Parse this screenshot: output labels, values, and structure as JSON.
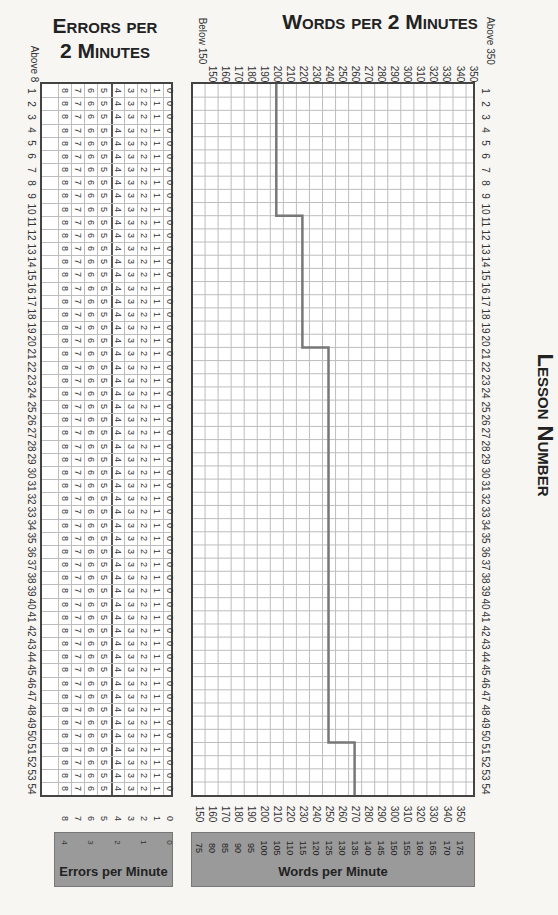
{
  "header": {
    "lesson_title": "Lesson Number",
    "words_title": "Words per 2 Minutes",
    "errors_title_line1": "Errors per",
    "errors_title_line2": "2 Minutes",
    "below_label": "Below 150",
    "above_label": "Above 350",
    "above_errors_label": "Above 8"
  },
  "words_axis": {
    "two_minute_ticks": [
      "150",
      "160",
      "170",
      "180",
      "190",
      "200",
      "210",
      "220",
      "230",
      "240",
      "250",
      "260",
      "270",
      "280",
      "290",
      "300",
      "310",
      "320",
      "330",
      "340",
      "350"
    ],
    "one_minute_ticks": [
      "75",
      "80",
      "85",
      "90",
      "95",
      "100",
      "105",
      "110",
      "115",
      "120",
      "125",
      "130",
      "135",
      "140",
      "145",
      "150",
      "155",
      "160",
      "165",
      "170",
      "175"
    ],
    "box_label": "Words per Minute"
  },
  "errors_axis": {
    "two_minute_ticks": [
      "8",
      "7",
      "6",
      "5",
      "4",
      "3",
      "2",
      "1",
      "0"
    ],
    "one_minute_ticks": [
      "4",
      "3",
      "2",
      "1",
      "0"
    ],
    "box_label": "Errors per Minute"
  },
  "lessons": {
    "count": 54
  },
  "colors": {
    "grid_line": "#bdbdbd",
    "step_line": "#777777",
    "gray_box": "#9a9a9a",
    "border": "#444444"
  },
  "chart_data": [
    {
      "type": "line",
      "title": "Words per 2 Minutes",
      "xlabel": "Words per 2 Minutes",
      "ylabel": "Lesson Number",
      "x_range": [
        150,
        350
      ],
      "y_range": [
        1,
        54
      ],
      "grid": true,
      "series": [
        {
          "name": "Target words per 2 minutes",
          "x": [
            1,
            10,
            11,
            20,
            21,
            50,
            51,
            54
          ],
          "values": [
            200,
            200,
            220,
            220,
            240,
            240,
            260,
            260
          ]
        }
      ],
      "segments": [
        {
          "lessons": "1-10",
          "words_per_2min": 200,
          "words_per_min": 100
        },
        {
          "lessons": "11-20",
          "words_per_2min": 220,
          "words_per_min": 110
        },
        {
          "lessons": "21-50",
          "words_per_2min": 240,
          "words_per_min": 120
        },
        {
          "lessons": "51-54",
          "words_per_2min": 260,
          "words_per_min": 130
        }
      ],
      "secondary_axis_label": "Words per Minute"
    },
    {
      "type": "table",
      "title": "Errors per 2 Minutes",
      "columns": [
        "Above 8",
        "8",
        "7",
        "6",
        "5",
        "4",
        "3",
        "2",
        "1",
        "0"
      ],
      "rows": 54,
      "secondary_axis_label": "Errors per Minute",
      "secondary_ticks": [
        "4",
        "3",
        "2",
        "1",
        "0"
      ]
    }
  ]
}
